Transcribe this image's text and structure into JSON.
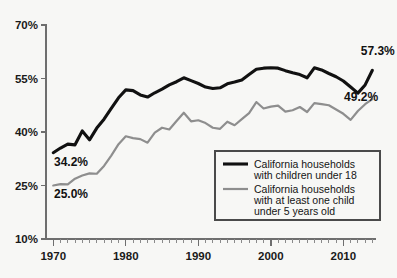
{
  "chart_data": {
    "type": "line",
    "title": "",
    "subtitle": "",
    "xlabel": "",
    "ylabel": "",
    "xlim": [
      1969.0,
      2014.5
    ],
    "ylim": [
      10,
      70
    ],
    "grid": false,
    "legend_position": "inside-bottom-right",
    "x_ticks_major": [
      1970,
      1980,
      1990,
      2000,
      2010
    ],
    "x_tick_labels": [
      "1970",
      "1980",
      "1990",
      "2000",
      "2010"
    ],
    "x_minor_tick_step": 1,
    "y_ticks": [
      10,
      25,
      40,
      55,
      70
    ],
    "y_tick_labels": [
      "10%",
      "25%",
      "40%",
      "55%",
      "70%"
    ],
    "x": [
      1970,
      1971,
      1972,
      1973,
      1974,
      1975,
      1976,
      1977,
      1978,
      1979,
      1980,
      1981,
      1982,
      1983,
      1984,
      1985,
      1986,
      1987,
      1988,
      1989,
      1990,
      1991,
      1992,
      1993,
      1994,
      1995,
      1996,
      1997,
      1998,
      1999,
      2000,
      2001,
      2002,
      2003,
      2004,
      2005,
      2006,
      2007,
      2008,
      2009,
      2010,
      2011,
      2012,
      2013,
      2014
    ],
    "series": [
      {
        "name": "California households with children under 18",
        "color": "#111111",
        "values": [
          34.2,
          35.5,
          36.6,
          36.4,
          40.3,
          37.8,
          41.1,
          43.6,
          46.6,
          49.6,
          51.8,
          51.6,
          50.4,
          49.8,
          51.0,
          52.0,
          53.2,
          54.1,
          55.2,
          54.4,
          53.6,
          52.6,
          52.2,
          52.4,
          53.5,
          54.0,
          54.6,
          56.1,
          57.6,
          57.9,
          58.0,
          57.9,
          57.2,
          56.6,
          56.1,
          55.2,
          58.0,
          57.4,
          56.4,
          55.5,
          54.3,
          52.6,
          50.9,
          53.2,
          57.3
        ]
      },
      {
        "name": "California households with at least one child under 5 years old",
        "color": "#8e8e8e",
        "values": [
          25.0,
          25.4,
          25.3,
          26.9,
          27.8,
          28.4,
          28.3,
          30.5,
          33.4,
          36.6,
          38.8,
          38.3,
          38.0,
          37.0,
          39.8,
          41.2,
          40.7,
          43.1,
          45.4,
          43.0,
          43.3,
          42.5,
          41.2,
          40.9,
          42.9,
          41.9,
          43.6,
          45.3,
          48.4,
          46.6,
          47.1,
          47.4,
          45.7,
          46.1,
          47.0,
          45.6,
          48.1,
          47.8,
          47.5,
          46.3,
          45.1,
          43.4,
          45.9,
          47.8,
          49.2
        ]
      }
    ],
    "annotations": [
      {
        "name": "primary-start-label",
        "text": "34.2%",
        "x": 1970.1,
        "y": 30.6,
        "anchor": "start"
      },
      {
        "name": "secondary-start-label",
        "text": "25.0%",
        "x": 1970.1,
        "y": 21.4,
        "anchor": "start"
      },
      {
        "name": "primary-end-label",
        "text": "57.3%",
        "x": 2012.4,
        "y": 61.7,
        "anchor": "start"
      },
      {
        "name": "secondary-end-label",
        "text": "49.2%",
        "x": 2010.1,
        "y": 48.6,
        "anchor": "start"
      }
    ],
    "legend": {
      "entries": [
        {
          "label_line1": "California households",
          "label_line2": "with children under 18",
          "label_line3": "",
          "color": "#111111"
        },
        {
          "label_line1": "California households",
          "label_line2": "with at least one child",
          "label_line3": "under 5 years old",
          "color": "#8e8e8e"
        }
      ]
    }
  },
  "colors": {
    "background": "#f7f7f5",
    "axis": "#6e6e6e",
    "primary_series": "#111111",
    "secondary_series": "#8e8e8e",
    "text": "#111111"
  }
}
